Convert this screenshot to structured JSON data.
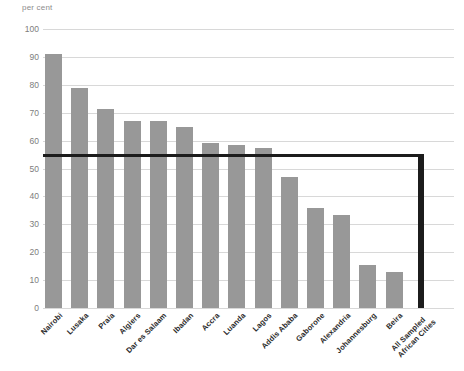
{
  "axis": {
    "unit_label": "per cent",
    "y_ticks": [
      100,
      90,
      80,
      70,
      60,
      50,
      40,
      30,
      20,
      10,
      0
    ]
  },
  "colors": {
    "bar": "#989898",
    "total_bar": "#1c1c1c",
    "reference_line": "#1c1c1c",
    "gridline": "#d8d8d8",
    "tick_text": "#7d7d7d",
    "category_text": "#2b2b2b"
  },
  "chart_data": {
    "type": "bar",
    "title": "",
    "xlabel": "",
    "ylabel": "per cent",
    "ylim": [
      0,
      100
    ],
    "y_ticks": [
      0,
      10,
      20,
      30,
      40,
      50,
      60,
      70,
      80,
      90,
      100
    ],
    "grid": true,
    "legend": "none",
    "categories": [
      "Nairobi",
      "Lusaka",
      "Praia",
      "Algiers",
      "Dar es Salaam",
      "Ibadan",
      "Accra",
      "Luanda",
      "Lagos",
      "Addis Ababa",
      "Gaborone",
      "Alexandria",
      "Johannesburg",
      "Beira",
      "All Sampled African Cities"
    ],
    "values": [
      91,
      79,
      71.5,
      67,
      67,
      65,
      59,
      58.5,
      57.5,
      47,
      36,
      33.5,
      15.5,
      12.8,
      54.8
    ],
    "annotations": [
      {
        "type": "reference-line",
        "value": 54.8,
        "label": "All Sampled African Cities average"
      }
    ]
  }
}
